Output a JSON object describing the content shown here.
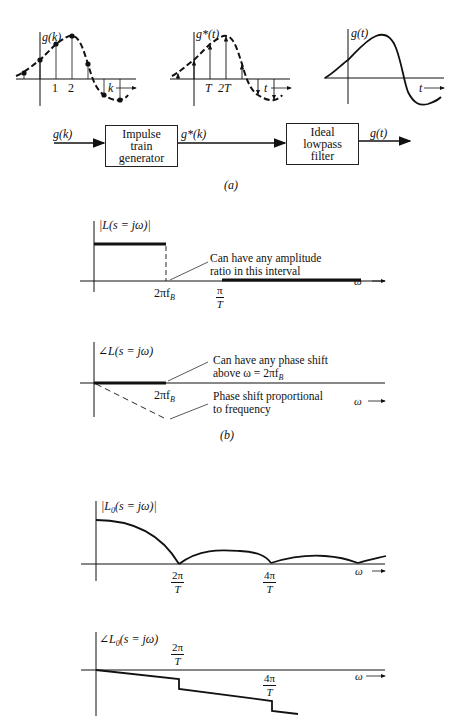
{
  "part_a": {
    "plot1": {
      "ylabel": "g(k)",
      "xticks": [
        "1",
        "2"
      ],
      "xlabel": "k"
    },
    "plot2": {
      "ylabel": "g*(t)",
      "xticks": [
        "T",
        "2T"
      ],
      "xlabel": "t"
    },
    "plot3": {
      "ylabel": "g(t)",
      "xlabel": "t"
    },
    "block_diagram": {
      "input_label": "g(k)",
      "block1": [
        "Impulse",
        "train",
        "generator"
      ],
      "mid_label": "g*(k)",
      "block2": [
        "Ideal",
        "lowpass",
        "filter"
      ],
      "output_label": "g(t)"
    },
    "caption": "(a)"
  },
  "part_b": {
    "magnitude": {
      "ylabel": "|L(s = jω)|",
      "tick_2pifb": "2πf",
      "tick_2pifb_sub": "B",
      "tick_pi_over_T": {
        "num": "π",
        "den": "T"
      },
      "annotation": [
        "Can have any amplitude",
        "ratio in this interval"
      ],
      "xlabel": "ω"
    },
    "phase": {
      "ylabel": "∠L(s = jω)",
      "tick_2pifb": "2πf",
      "tick_2pifb_sub": "B",
      "annotation_top": [
        "Can have any phase shift",
        "above ω = 2πf"
      ],
      "annotation_top_sub": "B",
      "annotation_bottom": [
        "Phase shift proportional",
        "to frequency"
      ],
      "xlabel": "ω"
    },
    "caption": "(b)"
  },
  "part_c": {
    "magnitude": {
      "ylabel": "|L",
      "ylabel_sub": "0",
      "ylabel_rest": "(s = jω)|",
      "ticks": [
        {
          "num": "2π",
          "den": "T"
        },
        {
          "num": "4π",
          "den": "T"
        }
      ],
      "xlabel": "ω"
    },
    "phase": {
      "ylabel": "∠L",
      "ylabel_sub": "0",
      "ylabel_rest": "(s = jω)",
      "ticks": [
        {
          "num": "2π",
          "den": "T"
        },
        {
          "num": "4π",
          "den": "T"
        }
      ],
      "xlabel": "ω"
    }
  }
}
